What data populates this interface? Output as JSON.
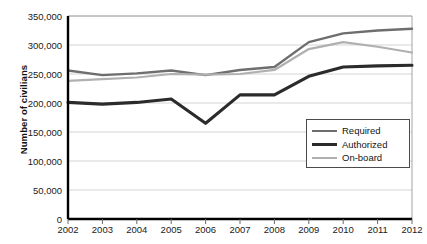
{
  "chart_data": {
    "type": "line",
    "title": "",
    "xlabel": "",
    "ylabel": "Number of civilians",
    "categories": [
      "2002",
      "2003",
      "2004",
      "2005",
      "2006",
      "2007",
      "2008",
      "2009",
      "2010",
      "2011",
      "2012"
    ],
    "x": [
      2002,
      2003,
      2004,
      2005,
      2006,
      2007,
      2008,
      2009,
      2010,
      2011,
      2012
    ],
    "ylim": [
      0,
      350000
    ],
    "xlim": [
      2002,
      2012
    ],
    "ytick_labels": [
      "0",
      "50,000",
      "100,000",
      "150,000",
      "200,000",
      "250,000",
      "300,000",
      "350,000"
    ],
    "ytick_values": [
      0,
      50000,
      100000,
      150000,
      200000,
      250000,
      300000,
      350000
    ],
    "grid": "horizontal",
    "legend_position": "bottom-right",
    "series": [
      {
        "name": "Required",
        "color": "#6e6e6e",
        "values": [
          256000,
          248000,
          251000,
          256000,
          248000,
          257000,
          262000,
          305000,
          320000,
          325000,
          328000
        ]
      },
      {
        "name": "Authorized",
        "color": "#2b2b2b",
        "values": [
          201000,
          198000,
          201000,
          207000,
          165000,
          214000,
          214000,
          246000,
          262000,
          264000,
          265000
        ]
      },
      {
        "name": "On-board",
        "color": "#b0b0b0",
        "values": [
          238000,
          241000,
          244000,
          250000,
          249000,
          250000,
          257000,
          293000,
          305000,
          297000,
          287000
        ]
      }
    ]
  },
  "legend": {
    "items": [
      {
        "label": "Required",
        "key": "required"
      },
      {
        "label": "Authorized",
        "key": "authorized"
      },
      {
        "label": "On-board",
        "key": "onboard"
      }
    ]
  }
}
